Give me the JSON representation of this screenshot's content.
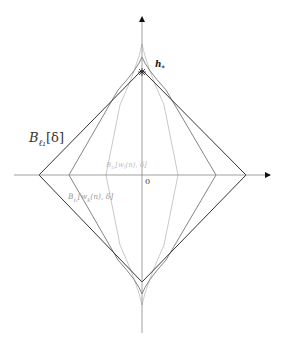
{
  "diagram": {
    "axes": {
      "origin_label": "0",
      "x_axis": {
        "from": [
          14,
          175
        ],
        "to": [
          270,
          175
        ]
      },
      "y_axis": {
        "from": [
          142,
          333
        ],
        "to": [
          142,
          17
        ]
      },
      "color": "#888888"
    },
    "shapes": [
      {
        "name": "outer-diamond",
        "label": "B_{ℓ1}[δ]",
        "label_display_main": "B",
        "label_display_sub": "ℓ₁",
        "label_display_rest": "[δ]",
        "points": [
          [
            39,
            175
          ],
          [
            142,
            68
          ],
          [
            246,
            175
          ],
          [
            142,
            282
          ]
        ],
        "color": "#333333"
      },
      {
        "name": "middle-shape",
        "label": "B_{ℓ1}[w_k(n), δ]",
        "label_display_main": "B",
        "label_display_sub": "ℓ₁",
        "label_display_rest": "[w",
        "label_display_sub2": "k",
        "label_display_tail": "(n), δ]",
        "points": [
          [
            69,
            175
          ],
          [
            142,
            57
          ],
          [
            216,
            175
          ],
          [
            142,
            294
          ]
        ],
        "color": "#777777"
      },
      {
        "name": "inner-shape",
        "label": "B_{ℓ1}[w_l(n), δ]",
        "label_display_main": "B",
        "label_display_sub": "ℓ₁",
        "label_display_rest": "[w",
        "label_display_sub2": "l",
        "label_display_tail": "(n), δ]",
        "points": [
          [
            106,
            175
          ],
          [
            142,
            44
          ],
          [
            178,
            175
          ],
          [
            142,
            305
          ]
        ],
        "color": "#bbbbbb"
      }
    ],
    "point_marker": {
      "label": "h",
      "label_sub": "*",
      "position": [
        142,
        72
      ],
      "symbol": "✱"
    }
  }
}
